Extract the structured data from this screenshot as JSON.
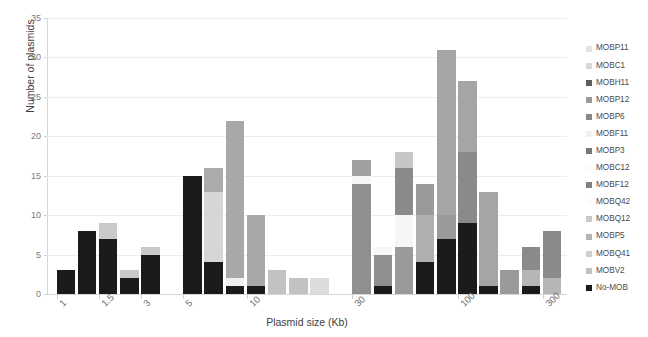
{
  "chart_data": {
    "type": "bar",
    "stacked": true,
    "title": "",
    "xlabel": "Plasmid size (Kb)",
    "ylabel": "Number of plasmids",
    "ylim": [
      0,
      35
    ],
    "yticks": [
      0,
      5,
      10,
      15,
      20,
      25,
      30,
      35
    ],
    "grid": true,
    "legend_position": "right",
    "xtick_labels": [
      "1",
      "1.5",
      "3",
      "5",
      "10",
      "30",
      "100",
      "300"
    ],
    "xtick_bin_index": [
      0,
      2,
      4,
      6,
      9,
      14,
      19,
      23
    ],
    "series": [
      {
        "name": "MOBP11",
        "color": "#e3e3e3",
        "values": [
          0,
          0,
          0,
          0,
          0,
          0,
          0,
          0,
          0,
          0,
          0,
          0,
          0,
          0,
          0,
          0,
          0,
          0,
          0,
          0,
          0,
          0,
          0,
          0
        ]
      },
      {
        "name": "MOBC1",
        "color": "#d8d8d8",
        "values": [
          0,
          0,
          0,
          0,
          0,
          0,
          0,
          0,
          0,
          0,
          0,
          0,
          0,
          0,
          0,
          0,
          0,
          0,
          0,
          0,
          0,
          0,
          0,
          0
        ]
      },
      {
        "name": "MOBH11",
        "color": "#5c5c5c",
        "values": [
          0,
          0,
          0,
          0,
          0,
          0,
          0,
          0,
          0,
          0,
          0,
          0,
          0,
          0,
          0,
          0,
          0,
          0,
          0,
          0,
          0,
          0,
          0,
          0
        ]
      },
      {
        "name": "MOBP12",
        "color": "#9a9a9a",
        "values": [
          0,
          0,
          0,
          0,
          0,
          0,
          0,
          0,
          0,
          0,
          0,
          0,
          0,
          0,
          0,
          0,
          0,
          0,
          0,
          0,
          0,
          0,
          0,
          0
        ]
      },
      {
        "name": "MOBP6",
        "color": "#888888",
        "values": [
          0,
          0,
          0,
          0,
          0,
          0,
          0,
          0,
          0,
          0,
          0,
          0,
          0,
          0,
          0,
          0,
          0,
          0,
          0,
          0,
          0,
          0,
          0,
          0
        ]
      },
      {
        "name": "MOBF11",
        "color": "#f2f2f2",
        "values": [
          0,
          0,
          0,
          0,
          0,
          0,
          0,
          0,
          0,
          0,
          0,
          0,
          0,
          0,
          0,
          0,
          0,
          0,
          0,
          0,
          0,
          0,
          0,
          0
        ]
      },
      {
        "name": "MOBP3",
        "color": "#787878",
        "values": [
          0,
          0,
          0,
          0,
          0,
          0,
          0,
          0,
          0,
          0,
          0,
          0,
          0,
          0,
          0,
          0,
          0,
          0,
          0,
          0,
          0,
          0,
          0,
          0
        ]
      },
      {
        "name": "MOBC12",
        "color": "#fafafa",
        "values": [
          0,
          0,
          0,
          0,
          0,
          0,
          0,
          0,
          0,
          0,
          0,
          0,
          0,
          0,
          0,
          0,
          0,
          0,
          0,
          0,
          0,
          0,
          0,
          0
        ]
      },
      {
        "name": "MOBF12",
        "color": "#7f7f7f",
        "values": [
          0,
          0,
          0,
          0,
          0,
          0,
          0,
          0,
          0,
          0,
          0,
          0,
          0,
          0,
          0,
          0,
          0,
          0,
          0,
          0,
          0,
          0,
          0,
          0
        ]
      },
      {
        "name": "MOBQ42",
        "color": "#fbfbfb",
        "values": [
          0,
          0,
          0,
          0,
          0,
          0,
          0,
          0,
          0,
          0,
          0,
          0,
          0,
          0,
          0,
          0,
          0,
          0,
          0,
          0,
          0,
          0,
          0,
          0
        ]
      },
      {
        "name": "MOBQ12",
        "color": "#c9c9c9",
        "values": [
          0,
          0,
          0,
          0,
          0,
          0,
          0,
          0,
          0,
          0,
          0,
          0,
          0,
          0,
          0,
          0,
          0,
          0,
          0,
          0,
          0,
          0,
          0,
          0
        ]
      },
      {
        "name": "MOBP5",
        "color": "#b4b4b4",
        "values": [
          0,
          0,
          0,
          0,
          0,
          0,
          0,
          0,
          0,
          0,
          0,
          0,
          0,
          0,
          0,
          0,
          0,
          0,
          0,
          0,
          0,
          0,
          0,
          0
        ]
      },
      {
        "name": "MOBQ41",
        "color": "#d0d0d0",
        "values": [
          0,
          0,
          0,
          0,
          0,
          0,
          0,
          0,
          0,
          0,
          0,
          0,
          0,
          0,
          0,
          0,
          0,
          0,
          0,
          0,
          0,
          0,
          0,
          0
        ]
      },
      {
        "name": "MOBV2",
        "color": "#c2c2c2",
        "values": [
          0,
          0,
          0,
          0,
          0,
          0,
          0,
          0,
          0,
          0,
          0,
          0,
          0,
          0,
          0,
          0,
          0,
          0,
          0,
          0,
          0,
          0,
          0,
          0
        ]
      },
      {
        "name": "No-MOB",
        "color": "#1b1b1b",
        "values": [
          0,
          0,
          0,
          0,
          0,
          0,
          0,
          0,
          0,
          0,
          0,
          0,
          0,
          0,
          0,
          0,
          0,
          0,
          0,
          0,
          0,
          0,
          0,
          0
        ]
      }
    ],
    "bars": [
      {
        "bin": 0,
        "total": 3,
        "segments": [
          {
            "name": "No-MOB",
            "value": 3,
            "color": "#1b1b1b"
          }
        ]
      },
      {
        "bin": 1,
        "total": 8,
        "segments": [
          {
            "name": "No-MOB",
            "value": 8,
            "color": "#1b1b1b"
          }
        ]
      },
      {
        "bin": 2,
        "total": 9,
        "segments": [
          {
            "name": "No-MOB",
            "value": 7,
            "color": "#1b1b1b"
          },
          {
            "name": "MOBQ12",
            "value": 2,
            "color": "#c9c9c9"
          }
        ]
      },
      {
        "bin": 3,
        "total": 3,
        "segments": [
          {
            "name": "No-MOB",
            "value": 2,
            "color": "#1b1b1b"
          },
          {
            "name": "MOBQ12",
            "value": 1,
            "color": "#c9c9c9"
          }
        ]
      },
      {
        "bin": 4,
        "total": 6,
        "segments": [
          {
            "name": "No-MOB",
            "value": 5,
            "color": "#1b1b1b"
          },
          {
            "name": "MOBQ12",
            "value": 1,
            "color": "#c9c9c9"
          }
        ]
      },
      {
        "bin": 5,
        "total": 0,
        "segments": []
      },
      {
        "bin": 6,
        "total": 15,
        "segments": [
          {
            "name": "No-MOB",
            "value": 15,
            "color": "#1b1b1b"
          }
        ]
      },
      {
        "bin": 7,
        "total": 16,
        "segments": [
          {
            "name": "No-MOB",
            "value": 4,
            "color": "#1b1b1b"
          },
          {
            "name": "MOBQ41",
            "value": 9,
            "color": "#d6d6d6"
          },
          {
            "name": "MOBP5",
            "value": 3,
            "color": "#ababab"
          }
        ]
      },
      {
        "bin": 8,
        "total": 22,
        "segments": [
          {
            "name": "No-MOB",
            "value": 1,
            "color": "#1b1b1b"
          },
          {
            "name": "MOBC12",
            "value": 1,
            "color": "#efefef"
          },
          {
            "name": "MOBP5",
            "value": 20,
            "color": "#a8a8a8"
          }
        ]
      },
      {
        "bin": 9,
        "total": 10,
        "segments": [
          {
            "name": "No-MOB",
            "value": 1,
            "color": "#1b1b1b"
          },
          {
            "name": "MOBP5",
            "value": 9,
            "color": "#a8a8a8"
          }
        ]
      },
      {
        "bin": 10,
        "total": 3,
        "segments": [
          {
            "name": "MOBP5",
            "value": 3,
            "color": "#c2c2c2"
          }
        ]
      },
      {
        "bin": 11,
        "total": 2,
        "segments": [
          {
            "name": "MOBP5",
            "value": 2,
            "color": "#c2c2c2"
          }
        ]
      },
      {
        "bin": 12,
        "total": 2,
        "segments": [
          {
            "name": "MOBQ41",
            "value": 2,
            "color": "#dcdcdc"
          }
        ]
      },
      {
        "bin": 13,
        "total": 0,
        "segments": []
      },
      {
        "bin": 14,
        "total": 17,
        "segments": [
          {
            "name": "MOBP5",
            "value": 14,
            "color": "#8f8f8f"
          },
          {
            "name": "MOBC12",
            "value": 1,
            "color": "#f6f6f6"
          },
          {
            "name": "MOBQ12",
            "value": 2,
            "color": "#a0a0a0"
          }
        ]
      },
      {
        "bin": 15,
        "total": 6,
        "segments": [
          {
            "name": "No-MOB",
            "value": 1,
            "color": "#1b1b1b"
          },
          {
            "name": "MOBP5",
            "value": 4,
            "color": "#8f8f8f"
          },
          {
            "name": "MOBC12",
            "value": 1,
            "color": "#f6f6f6"
          }
        ]
      },
      {
        "bin": 16,
        "total": 18,
        "segments": [
          {
            "name": "MOBP5",
            "value": 6,
            "color": "#9a9a9a"
          },
          {
            "name": "MOBC12",
            "value": 4,
            "color": "#f6f6f6"
          },
          {
            "name": "MOBQ12",
            "value": 6,
            "color": "#8a8a8a"
          },
          {
            "name": "MOBP12",
            "value": 2,
            "color": "#c6c6c6"
          }
        ]
      },
      {
        "bin": 17,
        "total": 14,
        "segments": [
          {
            "name": "No-MOB",
            "value": 4,
            "color": "#1b1b1b"
          },
          {
            "name": "MOBP5",
            "value": 6,
            "color": "#b0b0b0"
          },
          {
            "name": "MOBQ12",
            "value": 4,
            "color": "#9a9a9a"
          }
        ]
      },
      {
        "bin": 18,
        "total": 31,
        "segments": [
          {
            "name": "No-MOB",
            "value": 7,
            "color": "#1b1b1b"
          },
          {
            "name": "MOBP5",
            "value": 3,
            "color": "#9a9a9a"
          },
          {
            "name": "MOBQ12",
            "value": 21,
            "color": "#a5a5a5"
          }
        ]
      },
      {
        "bin": 19,
        "total": 27,
        "segments": [
          {
            "name": "No-MOB",
            "value": 9,
            "color": "#1b1b1b"
          },
          {
            "name": "MOBP5",
            "value": 9,
            "color": "#8a8a8a"
          },
          {
            "name": "MOBQ12",
            "value": 9,
            "color": "#a5a5a5"
          }
        ]
      },
      {
        "bin": 20,
        "total": 13,
        "segments": [
          {
            "name": "No-MOB",
            "value": 1,
            "color": "#1b1b1b"
          },
          {
            "name": "MOBP5",
            "value": 12,
            "color": "#a5a5a5"
          }
        ]
      },
      {
        "bin": 21,
        "total": 3,
        "segments": [
          {
            "name": "MOBP5",
            "value": 3,
            "color": "#9a9a9a"
          }
        ]
      },
      {
        "bin": 22,
        "total": 6,
        "segments": [
          {
            "name": "No-MOB",
            "value": 1,
            "color": "#1b1b1b"
          },
          {
            "name": "MOBP5",
            "value": 2,
            "color": "#b6b6b6"
          },
          {
            "name": "MOBQ12",
            "value": 3,
            "color": "#8a8a8a"
          }
        ]
      },
      {
        "bin": 23,
        "total": 8,
        "segments": [
          {
            "name": "MOBP5",
            "value": 2,
            "color": "#b6b6b6"
          },
          {
            "name": "MOBQ12",
            "value": 6,
            "color": "#8a8a8a"
          }
        ]
      }
    ]
  },
  "legend": {
    "items": [
      {
        "label": "MOBP11",
        "color": "#e3e3e3"
      },
      {
        "label": "MOBC1",
        "color": "#d8d8d8"
      },
      {
        "label": "MOBH11",
        "color": "#5c5c5c"
      },
      {
        "label": "MOBP12",
        "color": "#9a9a9a"
      },
      {
        "label": "MOBP6",
        "color": "#888888"
      },
      {
        "label": "MOBF11",
        "color": "#f2f2f2"
      },
      {
        "label": "MOBP3",
        "color": "#787878"
      },
      {
        "label": "MOBC12",
        "color": "#fafafa"
      },
      {
        "label": "MOBF12",
        "color": "#7f7f7f"
      },
      {
        "label": "MOBQ42",
        "color": "#fbfbfb"
      },
      {
        "label": "MOBQ12",
        "color": "#c9c9c9"
      },
      {
        "label": "MOBP5",
        "color": "#b4b4b4"
      },
      {
        "label": "MOBQ41",
        "color": "#d0d0d0"
      },
      {
        "label": "MOBV2",
        "color": "#c2c2c2"
      },
      {
        "label": "No-MOB",
        "color": "#1b1b1b"
      }
    ]
  }
}
